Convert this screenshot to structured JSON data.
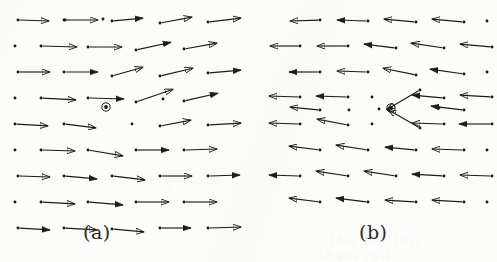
{
  "figure": {
    "type": "vector-field-pair",
    "background_color": "#fcfcfb",
    "ink_color": "#1a1a1a",
    "width": 497,
    "height": 262
  },
  "captions": {
    "panel_a": "(a)",
    "panel_b": "(b)"
  },
  "bleed_through": {
    "line1": "the motion",
    "line2": "observed"
  },
  "markers": {
    "center_marker_name": "circled-dot-marker",
    "panel_a_center": {
      "x": 106,
      "y": 107
    },
    "panel_b_center": {
      "x": 391,
      "y": 108
    }
  },
  "chart_data": {
    "type": "scatter",
    "title": "",
    "subtitle": "",
    "xlabel": "",
    "ylabel": "",
    "grid": false,
    "legend_position": "none",
    "panels": [
      {
        "name": "a",
        "label": "(a)",
        "dominant_direction": "right",
        "origin": {
          "x": 0,
          "y": 0
        },
        "vectors": [
          {
            "x": 18,
            "y": 20,
            "dx": 32,
            "dy": 1
          },
          {
            "x": 65,
            "y": 20,
            "dx": 0,
            "dy": 0
          },
          {
            "x": 64,
            "y": 20,
            "dx": 35,
            "dy": 0
          },
          {
            "x": 103,
            "y": 19,
            "dx": 2,
            "dy": 0
          },
          {
            "x": 112,
            "y": 21,
            "dx": 32,
            "dy": -3
          },
          {
            "x": 160,
            "y": 23,
            "dx": 33,
            "dy": -6
          },
          {
            "x": 208,
            "y": 22,
            "dx": 34,
            "dy": -4
          },
          {
            "x": 15,
            "y": 46,
            "dx": 1,
            "dy": 0
          },
          {
            "x": 41,
            "y": 46,
            "dx": 37,
            "dy": 1
          },
          {
            "x": 88,
            "y": 47,
            "dx": 35,
            "dy": 0
          },
          {
            "x": 136,
            "y": 50,
            "dx": 36,
            "dy": -8
          },
          {
            "x": 184,
            "y": 49,
            "dx": 34,
            "dy": -6
          },
          {
            "x": 18,
            "y": 72,
            "dx": 33,
            "dy": 0
          },
          {
            "x": 64,
            "y": 72,
            "dx": 35,
            "dy": 0
          },
          {
            "x": 112,
            "y": 76,
            "dx": 32,
            "dy": -9
          },
          {
            "x": 160,
            "y": 76,
            "dx": 34,
            "dy": -8
          },
          {
            "x": 208,
            "y": 73,
            "dx": 34,
            "dy": -3
          },
          {
            "x": 15,
            "y": 98,
            "dx": 1,
            "dy": 0
          },
          {
            "x": 41,
            "y": 98,
            "dx": 36,
            "dy": 2
          },
          {
            "x": 88,
            "y": 98,
            "dx": 37,
            "dy": 1
          },
          {
            "x": 136,
            "y": 102,
            "dx": 38,
            "dy": -13
          },
          {
            "x": 163,
            "y": 99,
            "dx": 1,
            "dy": 0
          },
          {
            "x": 184,
            "y": 101,
            "dx": 35,
            "dy": -8
          },
          {
            "x": 15,
            "y": 124,
            "dx": 34,
            "dy": 2
          },
          {
            "x": 64,
            "y": 124,
            "dx": 33,
            "dy": 4
          },
          {
            "x": 132,
            "y": 124,
            "dx": 1,
            "dy": 0
          },
          {
            "x": 160,
            "y": 126,
            "dx": 32,
            "dy": -6
          },
          {
            "x": 208,
            "y": 125,
            "dx": 34,
            "dy": -2
          },
          {
            "x": 15,
            "y": 150,
            "dx": 1,
            "dy": 0
          },
          {
            "x": 41,
            "y": 150,
            "dx": 35,
            "dy": 1
          },
          {
            "x": 88,
            "y": 150,
            "dx": 36,
            "dy": 6
          },
          {
            "x": 136,
            "y": 150,
            "dx": 34,
            "dy": 0
          },
          {
            "x": 184,
            "y": 150,
            "dx": 34,
            "dy": -1
          },
          {
            "x": 18,
            "y": 176,
            "dx": 33,
            "dy": 1
          },
          {
            "x": 64,
            "y": 176,
            "dx": 34,
            "dy": 3
          },
          {
            "x": 112,
            "y": 176,
            "dx": 34,
            "dy": 4
          },
          {
            "x": 160,
            "y": 176,
            "dx": 33,
            "dy": 0
          },
          {
            "x": 208,
            "y": 176,
            "dx": 33,
            "dy": -1
          },
          {
            "x": 15,
            "y": 202,
            "dx": 1,
            "dy": 0
          },
          {
            "x": 41,
            "y": 202,
            "dx": 35,
            "dy": 2
          },
          {
            "x": 88,
            "y": 202,
            "dx": 36,
            "dy": 3
          },
          {
            "x": 136,
            "y": 202,
            "dx": 34,
            "dy": 0
          },
          {
            "x": 184,
            "y": 202,
            "dx": 34,
            "dy": 0
          },
          {
            "x": 18,
            "y": 228,
            "dx": 33,
            "dy": 2
          },
          {
            "x": 64,
            "y": 228,
            "dx": 34,
            "dy": 2
          },
          {
            "x": 112,
            "y": 229,
            "dx": 33,
            "dy": 3
          },
          {
            "x": 160,
            "y": 228,
            "dx": 32,
            "dy": 0
          },
          {
            "x": 208,
            "y": 228,
            "dx": 34,
            "dy": -1
          }
        ]
      },
      {
        "name": "b",
        "label": "(b)",
        "dominant_direction": "left",
        "origin": {
          "x": 255,
          "y": 0
        },
        "vectors": [
          {
            "x": 320,
            "y": 20,
            "dx": -31,
            "dy": 1
          },
          {
            "x": 368,
            "y": 21,
            "dx": -32,
            "dy": -1
          },
          {
            "x": 416,
            "y": 22,
            "dx": -33,
            "dy": -3
          },
          {
            "x": 464,
            "y": 22,
            "dx": -33,
            "dy": -3
          },
          {
            "x": 487,
            "y": 21,
            "dx": -1,
            "dy": 0
          },
          {
            "x": 300,
            "y": 46,
            "dx": -31,
            "dy": 0
          },
          {
            "x": 348,
            "y": 46,
            "dx": -32,
            "dy": 0
          },
          {
            "x": 396,
            "y": 48,
            "dx": -33,
            "dy": -4
          },
          {
            "x": 444,
            "y": 48,
            "dx": -34,
            "dy": -5
          },
          {
            "x": 492,
            "y": 47,
            "dx": -33,
            "dy": -3
          },
          {
            "x": 320,
            "y": 72,
            "dx": -32,
            "dy": 0
          },
          {
            "x": 368,
            "y": 72,
            "dx": -32,
            "dy": -1
          },
          {
            "x": 416,
            "y": 75,
            "dx": -34,
            "dy": -7
          },
          {
            "x": 464,
            "y": 74,
            "dx": -35,
            "dy": -5
          },
          {
            "x": 487,
            "y": 72,
            "dx": -1,
            "dy": 0
          },
          {
            "x": 300,
            "y": 97,
            "dx": -32,
            "dy": -1
          },
          {
            "x": 348,
            "y": 97,
            "dx": -33,
            "dy": -1
          },
          {
            "x": 372,
            "y": 97,
            "dx": -1,
            "dy": 0
          },
          {
            "x": 420,
            "y": 90,
            "dx": -34,
            "dy": 20
          },
          {
            "x": 444,
            "y": 98,
            "dx": -33,
            "dy": -3
          },
          {
            "x": 492,
            "y": 97,
            "dx": -33,
            "dy": -2
          },
          {
            "x": 320,
            "y": 110,
            "dx": -31,
            "dy": -3
          },
          {
            "x": 349,
            "y": 110,
            "dx": -1,
            "dy": 0
          },
          {
            "x": 379,
            "y": 109,
            "dx": -1,
            "dy": 0
          },
          {
            "x": 439,
            "y": 108,
            "dx": -1,
            "dy": 0
          },
          {
            "x": 464,
            "y": 110,
            "dx": -34,
            "dy": -4
          },
          {
            "x": 300,
            "y": 124,
            "dx": -32,
            "dy": -1
          },
          {
            "x": 348,
            "y": 125,
            "dx": -32,
            "dy": -6
          },
          {
            "x": 372,
            "y": 124,
            "dx": -1,
            "dy": 0
          },
          {
            "x": 420,
            "y": 128,
            "dx": -33,
            "dy": -19
          },
          {
            "x": 444,
            "y": 124,
            "dx": -33,
            "dy": -1
          },
          {
            "x": 492,
            "y": 124,
            "dx": -34,
            "dy": 0
          },
          {
            "x": 320,
            "y": 150,
            "dx": -32,
            "dy": -4
          },
          {
            "x": 368,
            "y": 150,
            "dx": -33,
            "dy": -5
          },
          {
            "x": 416,
            "y": 150,
            "dx": -32,
            "dy": -3
          },
          {
            "x": 464,
            "y": 150,
            "dx": -33,
            "dy": -1
          },
          {
            "x": 487,
            "y": 150,
            "dx": -1,
            "dy": 0
          },
          {
            "x": 300,
            "y": 176,
            "dx": -32,
            "dy": -1
          },
          {
            "x": 348,
            "y": 176,
            "dx": -33,
            "dy": -5
          },
          {
            "x": 396,
            "y": 176,
            "dx": -33,
            "dy": -5
          },
          {
            "x": 444,
            "y": 176,
            "dx": -33,
            "dy": -2
          },
          {
            "x": 492,
            "y": 176,
            "dx": -33,
            "dy": -1
          },
          {
            "x": 320,
            "y": 202,
            "dx": -32,
            "dy": -4
          },
          {
            "x": 368,
            "y": 202,
            "dx": -33,
            "dy": -4
          },
          {
            "x": 416,
            "y": 202,
            "dx": -32,
            "dy": -2
          },
          {
            "x": 464,
            "y": 202,
            "dx": -33,
            "dy": -2
          },
          {
            "x": 487,
            "y": 202,
            "dx": -1,
            "dy": 0
          }
        ]
      }
    ]
  }
}
